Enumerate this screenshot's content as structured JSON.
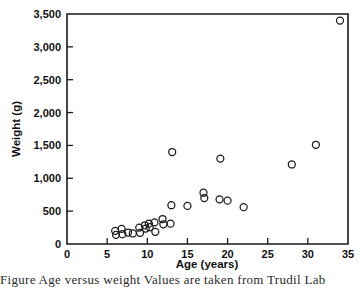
{
  "chart_data": {
    "type": "scatter",
    "title": "",
    "xlabel": "Age (years)",
    "ylabel": "Weight (g)",
    "xlim": [
      0,
      35
    ],
    "ylim": [
      0,
      3500
    ],
    "xticks": [
      0,
      5,
      10,
      15,
      20,
      25,
      30,
      35
    ],
    "yticks": [
      0,
      500,
      1000,
      1500,
      2000,
      2500,
      3000,
      3500
    ],
    "xtick_labels": [
      "0",
      "5",
      "10",
      "15",
      "20",
      "25",
      "30",
      "35"
    ],
    "ytick_labels": [
      "0",
      "500",
      "1,000",
      "1,500",
      "2,000",
      "2,500",
      "3,000",
      "3,500"
    ],
    "grid": false,
    "legend": false,
    "marker": "open-circle",
    "marker_color": "#1a1a1a",
    "points": [
      {
        "x": 6.0,
        "y": 200
      },
      {
        "x": 6.1,
        "y": 140
      },
      {
        "x": 6.8,
        "y": 230
      },
      {
        "x": 6.9,
        "y": 150
      },
      {
        "x": 7.6,
        "y": 175
      },
      {
        "x": 8.2,
        "y": 160
      },
      {
        "x": 9.0,
        "y": 250
      },
      {
        "x": 9.1,
        "y": 170
      },
      {
        "x": 9.7,
        "y": 285
      },
      {
        "x": 9.8,
        "y": 235
      },
      {
        "x": 10.2,
        "y": 310
      },
      {
        "x": 10.3,
        "y": 255
      },
      {
        "x": 10.9,
        "y": 330
      },
      {
        "x": 11.0,
        "y": 185
      },
      {
        "x": 11.9,
        "y": 380
      },
      {
        "x": 12.0,
        "y": 300
      },
      {
        "x": 12.9,
        "y": 310
      },
      {
        "x": 13.0,
        "y": 590
      },
      {
        "x": 13.1,
        "y": 1400
      },
      {
        "x": 15.0,
        "y": 580
      },
      {
        "x": 17.0,
        "y": 780
      },
      {
        "x": 17.1,
        "y": 700
      },
      {
        "x": 19.0,
        "y": 680
      },
      {
        "x": 19.1,
        "y": 1300
      },
      {
        "x": 20.0,
        "y": 660
      },
      {
        "x": 22.0,
        "y": 560
      },
      {
        "x": 28.0,
        "y": 1210
      },
      {
        "x": 31.0,
        "y": 1510
      },
      {
        "x": 34.0,
        "y": 3400
      }
    ]
  },
  "caption": {
    "text": "Figure  Age versus weight  Values are taken from Trudil Lab"
  }
}
